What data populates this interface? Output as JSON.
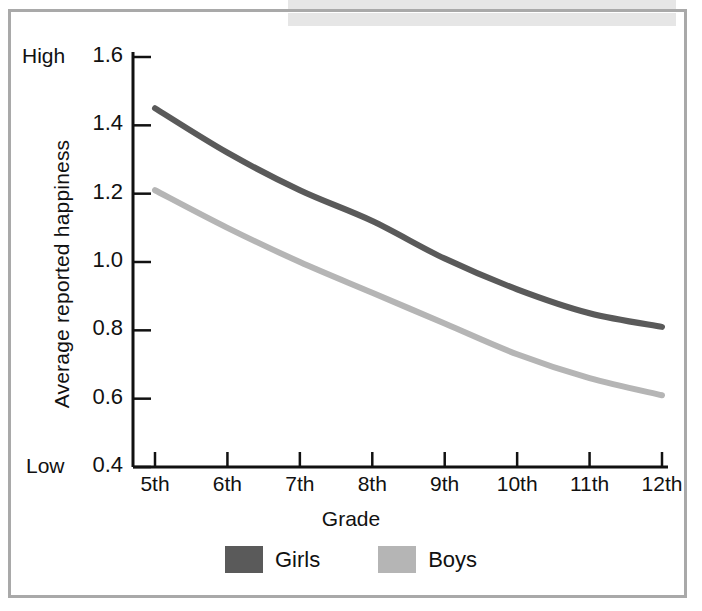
{
  "chart_data": {
    "type": "line",
    "title": "",
    "xlabel": "Grade",
    "ylabel": "Average reported happiness",
    "y_axis_high_label": "High",
    "y_axis_low_label": "Low",
    "categories": [
      "5th",
      "6th",
      "7th",
      "8th",
      "9th",
      "10th",
      "11th",
      "12th"
    ],
    "x": [
      5,
      6,
      7,
      8,
      9,
      10,
      11,
      12
    ],
    "ylim": [
      0.4,
      1.6
    ],
    "yticks": [
      "1.6",
      "1.4",
      "1.2",
      "1.0",
      "0.8",
      "0.6",
      "0.4"
    ],
    "ytick_values": [
      1.6,
      1.4,
      1.2,
      1.0,
      0.8,
      0.6,
      0.4
    ],
    "grid": false,
    "legend_position": "bottom",
    "series": [
      {
        "name": "Girls",
        "color": "#5a5a5a",
        "values": [
          1.45,
          1.32,
          1.21,
          1.12,
          1.01,
          0.92,
          0.85,
          0.81
        ]
      },
      {
        "name": "Boys",
        "color": "#b5b5b5",
        "values": [
          1.21,
          1.1,
          1.0,
          0.91,
          0.82,
          0.73,
          0.66,
          0.61
        ]
      }
    ]
  },
  "legend": {
    "items": [
      {
        "label": "Girls",
        "color": "#5a5a5a"
      },
      {
        "label": "Boys",
        "color": "#b5b5b5"
      }
    ]
  },
  "axes": {
    "x_title": "Grade",
    "y_title": "Average reported happiness",
    "high": "High",
    "low": "Low"
  }
}
